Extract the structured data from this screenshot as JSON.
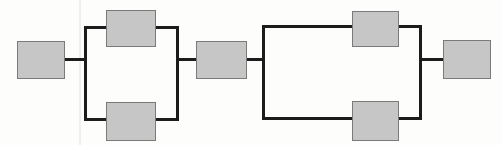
{
  "diagram": {
    "type": "reliability-block-diagram",
    "canvas": {
      "width": 502,
      "height": 145
    },
    "style": {
      "background_color": "#fdfdfc",
      "block_fill_color": "#c6c6c6",
      "block_border_color": "#7a7a7a",
      "block_border_width": 1,
      "connector_color": "#1c1c1c",
      "connector_width": 3,
      "artifact_line_color": "#e2e2e2"
    },
    "blocks": [
      {
        "id": "block-input",
        "label": "",
        "x": 17,
        "y": 41,
        "w": 47,
        "h": 37,
        "role": "series-input"
      },
      {
        "id": "block-a-top",
        "label": "",
        "x": 106,
        "y": 10,
        "w": 49,
        "h": 36,
        "role": "parallel-branch-upper"
      },
      {
        "id": "block-a-bottom",
        "label": "",
        "x": 106,
        "y": 102,
        "w": 49,
        "h": 38,
        "role": "parallel-branch-lower"
      },
      {
        "id": "block-middle",
        "label": "",
        "x": 196,
        "y": 41,
        "w": 50,
        "h": 37,
        "role": "series-middle"
      },
      {
        "id": "block-b-top",
        "label": "",
        "x": 352,
        "y": 11,
        "w": 46,
        "h": 35,
        "role": "parallel-branch-upper"
      },
      {
        "id": "block-b-bottom",
        "label": "",
        "x": 352,
        "y": 101,
        "w": 46,
        "h": 39,
        "role": "parallel-branch-lower"
      },
      {
        "id": "block-output",
        "label": "",
        "x": 443,
        "y": 40,
        "w": 47,
        "h": 38,
        "role": "series-output"
      }
    ],
    "connectors": [
      {
        "id": "conn-input-to-rail1",
        "orientation": "horizontal",
        "x1": 63,
        "y1": 59,
        "x2": 87,
        "y2": 59
      },
      {
        "id": "rail-1-left",
        "orientation": "vertical",
        "x1": 85,
        "y1": 26,
        "x2": 85,
        "y2": 121
      },
      {
        "id": "conn-rail1-top",
        "orientation": "horizontal",
        "x1": 84,
        "y1": 27,
        "x2": 107,
        "y2": 27
      },
      {
        "id": "conn-rail1-bottom",
        "orientation": "horizontal",
        "x1": 84,
        "y1": 119,
        "x2": 107,
        "y2": 119
      },
      {
        "id": "conn-top1-to-rail2",
        "orientation": "horizontal",
        "x1": 154,
        "y1": 27,
        "x2": 179,
        "y2": 27
      },
      {
        "id": "conn-bottom1-to-rail2",
        "orientation": "horizontal",
        "x1": 154,
        "y1": 119,
        "x2": 179,
        "y2": 119
      },
      {
        "id": "rail-1-right",
        "orientation": "vertical",
        "x1": 177,
        "y1": 26,
        "x2": 177,
        "y2": 120
      },
      {
        "id": "conn-rail2-to-middle",
        "orientation": "horizontal",
        "x1": 176,
        "y1": 59,
        "x2": 197,
        "y2": 59
      },
      {
        "id": "conn-middle-to-rail3",
        "orientation": "horizontal",
        "x1": 245,
        "y1": 59,
        "x2": 265,
        "y2": 59
      },
      {
        "id": "rail-2-left",
        "orientation": "vertical",
        "x1": 263,
        "y1": 25,
        "x2": 263,
        "y2": 120
      },
      {
        "id": "conn-rail3-top",
        "orientation": "horizontal",
        "x1": 262,
        "y1": 26,
        "x2": 353,
        "y2": 26
      },
      {
        "id": "conn-rail3-bottom",
        "orientation": "horizontal",
        "x1": 262,
        "y1": 118,
        "x2": 353,
        "y2": 118
      },
      {
        "id": "conn-top2-to-rail4",
        "orientation": "horizontal",
        "x1": 397,
        "y1": 26,
        "x2": 422,
        "y2": 26
      },
      {
        "id": "conn-bottom2-to-rail4",
        "orientation": "horizontal",
        "x1": 397,
        "y1": 118,
        "x2": 422,
        "y2": 118
      },
      {
        "id": "rail-2-right",
        "orientation": "vertical",
        "x1": 420,
        "y1": 25,
        "x2": 420,
        "y2": 119
      },
      {
        "id": "conn-rail4-to-output",
        "orientation": "horizontal",
        "x1": 419,
        "y1": 59,
        "x2": 444,
        "y2": 59
      }
    ],
    "artifacts": [
      {
        "id": "scan-line-vertical",
        "x1": 80,
        "y1": 0,
        "x2": 80,
        "y2": 145
      }
    ]
  }
}
